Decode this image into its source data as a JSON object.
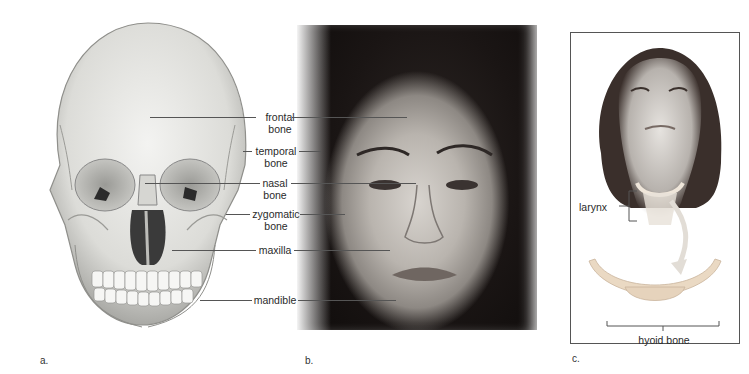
{
  "figure": {
    "panels": [
      {
        "id": "a",
        "letter": "a.",
        "content": "skull-anterior-illustration"
      },
      {
        "id": "b",
        "letter": "b.",
        "content": "face-photograph"
      },
      {
        "id": "c",
        "letter": "c.",
        "content": "neck-hyoid-illustration"
      }
    ],
    "labels_ab": [
      {
        "line1": "frontal",
        "line2": "bone"
      },
      {
        "line1": "temporal",
        "line2": "bone"
      },
      {
        "line1": "nasal",
        "line2": "bone"
      },
      {
        "line1": "zygomatic",
        "line2": "bone"
      },
      {
        "line1": "maxilla",
        "line2": ""
      },
      {
        "line1": "mandible",
        "line2": ""
      }
    ],
    "labels_c": {
      "larynx": "larynx",
      "hyoid": "hyoid bone"
    },
    "colors": {
      "bone_light": "#ececea",
      "bone_shade": "#b8b8b4",
      "hyoid": "#e8d9c6",
      "leader_line": "#555555",
      "frame": "#555555"
    }
  }
}
